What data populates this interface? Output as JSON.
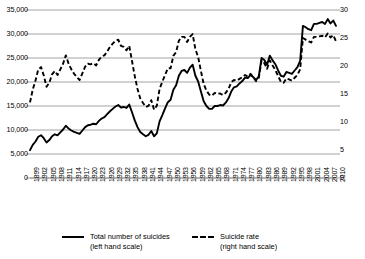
{
  "chart_data": {
    "type": "line",
    "title": "",
    "xlabel": "",
    "ylabel": "",
    "grid": true,
    "legend_position": "bottom",
    "x": [
      1899,
      1900,
      1901,
      1902,
      1903,
      1904,
      1905,
      1906,
      1907,
      1908,
      1909,
      1910,
      1911,
      1912,
      1913,
      1914,
      1915,
      1916,
      1917,
      1918,
      1919,
      1920,
      1921,
      1922,
      1923,
      1924,
      1925,
      1926,
      1927,
      1928,
      1929,
      1930,
      1931,
      1932,
      1933,
      1934,
      1935,
      1936,
      1937,
      1938,
      1939,
      1940,
      1941,
      1942,
      1943,
      1944,
      1945,
      1946,
      1947,
      1948,
      1949,
      1950,
      1951,
      1952,
      1953,
      1954,
      1955,
      1956,
      1957,
      1958,
      1959,
      1960,
      1961,
      1962,
      1963,
      1964,
      1965,
      1966,
      1967,
      1968,
      1969,
      1970,
      1971,
      1972,
      1973,
      1974,
      1975,
      1976,
      1977,
      1978,
      1979,
      1980,
      1981,
      1982,
      1983,
      1984,
      1985,
      1986,
      1987,
      1988,
      1989,
      1990,
      1991,
      1992,
      1993,
      1994,
      1995,
      1996,
      1997,
      1998,
      1999,
      2000,
      2001,
      2002,
      2003,
      2004,
      2005,
      2006,
      2007,
      2008,
      2009,
      2010
    ],
    "xtick_labels": [
      "1899",
      "1902",
      "1905",
      "1908",
      "1911",
      "1914",
      "1917",
      "1920",
      "1923",
      "1926",
      "1929",
      "1932",
      "1935",
      "1938",
      "1941",
      "1944",
      "1947",
      "1950",
      "1953",
      "1956",
      "1959",
      "1962",
      "1965",
      "1968",
      "1971",
      "1974",
      "1977",
      "1980",
      "1983",
      "1986",
      "1989",
      "1992",
      "1995",
      "1998",
      "2001",
      "2004",
      "2007",
      "2010"
    ],
    "xtick_step_years": 3,
    "xlim": [
      1899,
      2010
    ],
    "left_axis": {
      "title": "Total number of suicides (left hand scale)",
      "ticks": [
        "0",
        "5,000",
        "10,000",
        "15,000",
        "20,000",
        "25,000",
        "30,000",
        "35,000"
      ],
      "tick_values": [
        0,
        5000,
        10000,
        15000,
        20000,
        25000,
        30000,
        35000
      ],
      "ylim": [
        0,
        35000
      ]
    },
    "right_axis": {
      "title": "Suicide rate (right hand scale)",
      "ticks": [
        "0",
        "5",
        "10",
        "15",
        "20",
        "25",
        "30"
      ],
      "tick_values": [
        0,
        5,
        10,
        15,
        20,
        25,
        30
      ],
      "ylim": [
        0,
        30
      ]
    },
    "series": [
      {
        "name": "Total number of suicides",
        "axis": "left",
        "style": "solid",
        "color": "#000000",
        "values": [
          5800,
          6900,
          7600,
          8600,
          8900,
          8300,
          7400,
          7900,
          8700,
          9100,
          8900,
          9500,
          10100,
          10900,
          10300,
          9900,
          9600,
          9400,
          9200,
          9900,
          10600,
          11000,
          11100,
          11300,
          11200,
          11900,
          12400,
          12700,
          13300,
          13900,
          14400,
          14900,
          15200,
          14700,
          14800,
          14600,
          15300,
          13700,
          12000,
          10600,
          9600,
          9100,
          8700,
          9000,
          9800,
          8700,
          9300,
          11800,
          13100,
          14500,
          15800,
          16300,
          18400,
          19300,
          21300,
          22300,
          22500,
          21900,
          23000,
          23600,
          21300,
          20100,
          18000,
          16000,
          15000,
          14400,
          14400,
          15000,
          15000,
          15200,
          15100,
          15700,
          16600,
          18000,
          18900,
          19100,
          19700,
          20200,
          20900,
          20800,
          21500,
          21000,
          20400,
          21200,
          25000,
          24600,
          23600,
          25500,
          24500,
          23700,
          22400,
          21300,
          21100,
          22100,
          21900,
          21700,
          22400,
          23100,
          24400,
          31700,
          31400,
          31000,
          30800,
          32100,
          32100,
          32300,
          32500,
          32100,
          33100,
          32200,
          32800,
          31700
        ],
        "note": "Solid line, left scale. Sharp rise in 1998 to over 31,000."
      },
      {
        "name": "Suicide rate",
        "axis": "right",
        "style": "dashed",
        "color": "#000000",
        "values": [
          13.5,
          15.8,
          17.4,
          19.4,
          19.8,
          18.3,
          16.3,
          17.0,
          18.5,
          19.1,
          18.4,
          19.4,
          20.4,
          21.9,
          20.4,
          19.4,
          18.6,
          18.0,
          17.5,
          18.7,
          19.9,
          20.4,
          20.3,
          20.5,
          20.1,
          21.1,
          21.7,
          21.9,
          22.6,
          23.4,
          24.0,
          24.5,
          24.7,
          23.6,
          23.4,
          22.8,
          23.6,
          20.9,
          18.2,
          15.9,
          14.2,
          13.4,
          12.7,
          12.9,
          13.9,
          12.2,
          12.9,
          15.9,
          17.2,
          18.4,
          19.6,
          19.6,
          21.8,
          22.5,
          24.5,
          25.2,
          25.2,
          24.3,
          25.2,
          25.7,
          23.0,
          21.6,
          19.1,
          16.8,
          15.6,
          14.9,
          14.7,
          15.2,
          15.0,
          15.1,
          14.8,
          15.2,
          15.9,
          17.1,
          17.5,
          17.4,
          17.7,
          18.0,
          18.4,
          18.1,
          18.6,
          18.0,
          17.3,
          17.9,
          21.0,
          20.5,
          19.5,
          21.0,
          20.1,
          19.3,
          18.2,
          17.2,
          17.0,
          17.8,
          17.6,
          17.4,
          17.9,
          18.4,
          19.4,
          25.0,
          24.7,
          24.4,
          24.2,
          25.2,
          25.2,
          25.3,
          25.4,
          25.1,
          25.8,
          25.1,
          25.5,
          24.4
        ],
        "note": "Dashed line, right scale, per 100,000 population."
      }
    ]
  },
  "legend": {
    "entries": [
      {
        "key": "solid-line-key",
        "label_main": "Total number of suicides",
        "label_sub": "(left hand scale)",
        "style": "solid"
      },
      {
        "key": "dashed-line-key",
        "label_main": "Suicide rate",
        "label_sub": "(right hand scale)",
        "style": "dashed"
      }
    ]
  }
}
